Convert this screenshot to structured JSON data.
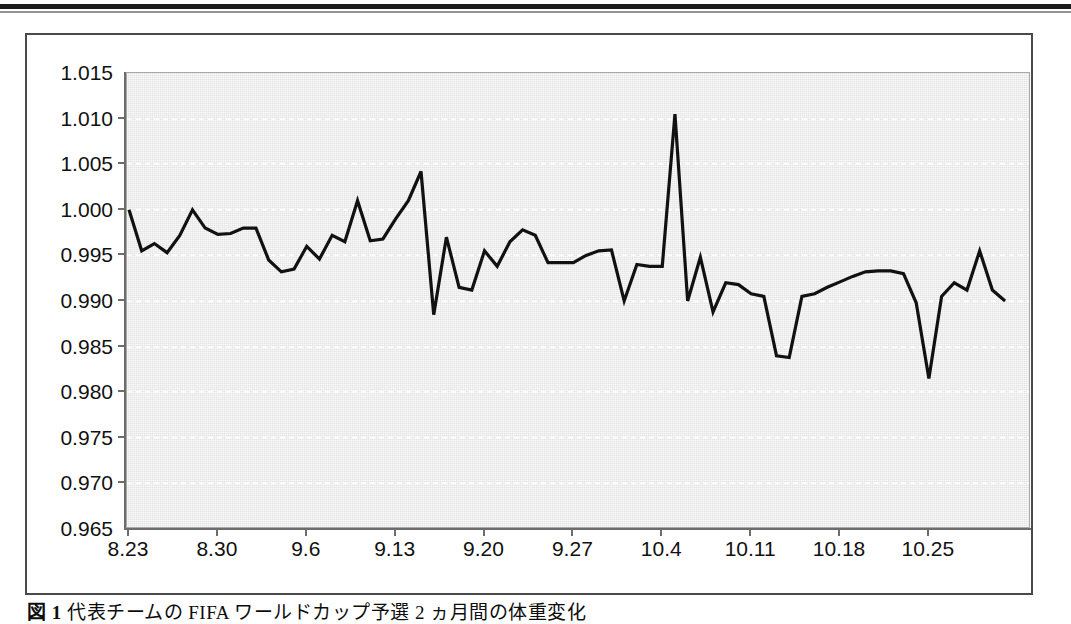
{
  "figure": {
    "caption_label": "図 1",
    "caption_text": "代表チームの FIFA ワールドカップ予選 2 ヵ月間の体重変化"
  },
  "colors": {
    "plot_background": "#e3e3e3",
    "gridline": "#ffffff",
    "line": "#111111",
    "axis": "#6d6d6d",
    "frame": "#4a4a4a",
    "text": "#111111"
  },
  "chart_data": {
    "type": "line",
    "title": "",
    "subtitle": "",
    "xlabel": "",
    "ylabel": "",
    "grid": true,
    "legend": false,
    "legend_position": "none",
    "ylim": [
      0.965,
      1.015
    ],
    "y_ticks": [
      0.965,
      0.97,
      0.975,
      0.98,
      0.985,
      0.99,
      0.995,
      1.0,
      1.005,
      1.01,
      1.015
    ],
    "y_tick_labels": [
      "0.965",
      "0.970",
      "0.975",
      "0.980",
      "0.985",
      "0.990",
      "0.995",
      "1.000",
      "1.005",
      "1.010",
      "1.015"
    ],
    "x_tick_labels": [
      "8.23",
      "8.30",
      "9.6",
      "9.13",
      "9.20",
      "9.27",
      "10.4",
      "10.11",
      "10.18",
      "10.25"
    ],
    "x_tick_indices": [
      0,
      7,
      14,
      21,
      28,
      35,
      42,
      49,
      56,
      63
    ],
    "series": [
      {
        "name": "体重比",
        "values": [
          1.0,
          0.9955,
          0.9963,
          0.9953,
          0.9972,
          1.0,
          0.998,
          0.9973,
          0.9974,
          0.998,
          0.998,
          0.9945,
          0.9932,
          0.9935,
          0.996,
          0.9946,
          0.9972,
          0.9965,
          1.001,
          0.9966,
          0.9968,
          0.999,
          1.001,
          1.0042,
          0.9885,
          0.997,
          0.9915,
          0.9912,
          0.9955,
          0.9938,
          0.9965,
          0.9978,
          0.9972,
          0.9942,
          0.9942,
          0.9942,
          0.995,
          0.9955,
          0.9956,
          0.99,
          0.994,
          0.9938,
          0.9938,
          1.0105,
          0.99,
          0.9948,
          0.9888,
          0.992,
          0.9918,
          0.9908,
          0.9905,
          0.984,
          0.9838,
          0.9905,
          0.9908,
          0.9915,
          0.9921,
          0.9927,
          0.9932,
          0.9933,
          0.9933,
          0.993,
          0.9898,
          0.9815,
          0.9905,
          0.992,
          0.9912,
          0.9955,
          0.9912,
          0.99
        ]
      }
    ]
  }
}
